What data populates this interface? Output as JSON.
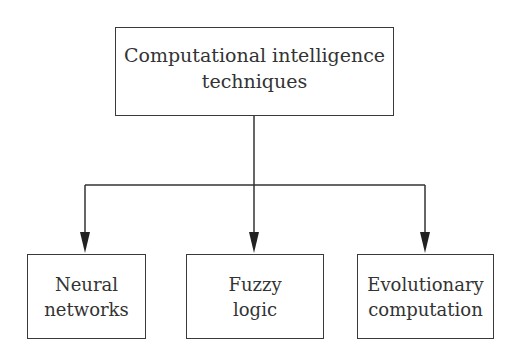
{
  "diagram": {
    "type": "hierarchy",
    "root": {
      "label_lines": [
        "Computational intelligence",
        "techniques"
      ],
      "box": {
        "x": 115,
        "y": 27,
        "w": 278,
        "h": 89
      }
    },
    "children": [
      {
        "label_lines": [
          "Neural",
          "networks"
        ],
        "box": {
          "x": 27,
          "y": 254,
          "w": 118,
          "h": 85
        },
        "arrow_x": 85
      },
      {
        "label_lines": [
          "Fuzzy",
          "logic"
        ],
        "box": {
          "x": 186,
          "y": 254,
          "w": 137,
          "h": 85
        },
        "arrow_x": 254
      },
      {
        "label_lines": [
          "Evolutionary",
          "computation"
        ],
        "box": {
          "x": 357,
          "y": 254,
          "w": 136,
          "h": 85
        },
        "arrow_x": 425
      }
    ],
    "connector": {
      "trunk_x": 254,
      "bar_y": 185,
      "arrow_tip_y": 253,
      "stroke": "#333333"
    }
  }
}
